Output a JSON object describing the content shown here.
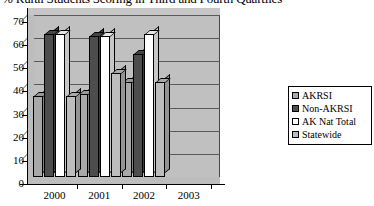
{
  "chart_data": {
    "type": "bar",
    "title": "% Rural Students Scoring in Third and Fourth Quartiles",
    "xlabel": "",
    "ylabel": "",
    "categories": [
      "2000",
      "2001",
      "2002",
      "2003"
    ],
    "ylim": [
      0,
      70
    ],
    "yticks": [
      "0",
      "10",
      "20",
      "30",
      "40",
      "50",
      "60",
      "70"
    ],
    "grid": true,
    "legend_position": "right",
    "style": "3d-column",
    "series": [
      {
        "name": "AKRSI",
        "color": "#a8a8a8",
        "values": [
          35,
          36,
          41,
          null
        ]
      },
      {
        "name": "Non-AKRSI",
        "color": "#4d4d4d",
        "values": [
          62,
          61,
          53,
          null
        ]
      },
      {
        "name": "AK Nat Total",
        "color": "#ffffff",
        "values": [
          62,
          61,
          62,
          null
        ]
      },
      {
        "name": "Statewide",
        "color": "#bdbdbd",
        "values": [
          35,
          45,
          41,
          null
        ]
      }
    ]
  },
  "legend": {
    "items": [
      {
        "label": "AKRSI"
      },
      {
        "label": "Non-AKRSI"
      },
      {
        "label": "AK Nat Total"
      },
      {
        "label": "Statewide"
      }
    ]
  },
  "colors": {
    "plot_background": "#c0c0c0",
    "plot_wall": "#c6c6c6",
    "gridline": "#5a5a5a",
    "axis": "#000000",
    "page_background": "#ffffff"
  }
}
